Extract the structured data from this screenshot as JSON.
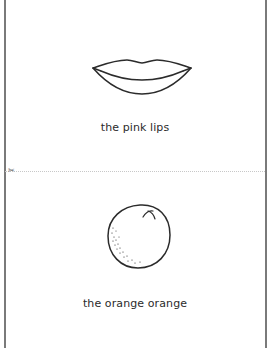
{
  "cards": [
    {
      "illustration": "lips-icon",
      "caption": "the pink lips"
    },
    {
      "illustration": "orange-icon",
      "caption": "the orange orange"
    }
  ],
  "cut_line": {
    "icon": "scissors-icon",
    "glyph": "✂"
  },
  "colors": {
    "line": "#2b2b2b",
    "border": "#7a7a7a",
    "cut_line": "#c8c8c8",
    "background": "#ffffff"
  }
}
